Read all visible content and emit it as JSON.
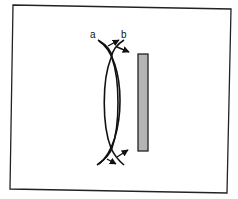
{
  "diagram": {
    "type": "optics-schematic",
    "labels": {
      "a": "a",
      "b": "b"
    },
    "colors": {
      "background": "#ffffff",
      "frame": "#222222",
      "stroke": "#111111",
      "plate_fill": "#b4b4b4",
      "plate_stroke": "#222222"
    },
    "elements": [
      {
        "id": "frame",
        "kind": "rectangle-outline"
      },
      {
        "id": "arc-a",
        "kind": "curved-line",
        "label": "a"
      },
      {
        "id": "arc-b",
        "kind": "curved-line",
        "label": "b"
      },
      {
        "id": "top-arrows",
        "kind": "arrowheads",
        "count": 2
      },
      {
        "id": "bottom-arrows",
        "kind": "arrowheads",
        "count": 2
      },
      {
        "id": "plate",
        "kind": "gray-vertical-bar"
      }
    ]
  }
}
